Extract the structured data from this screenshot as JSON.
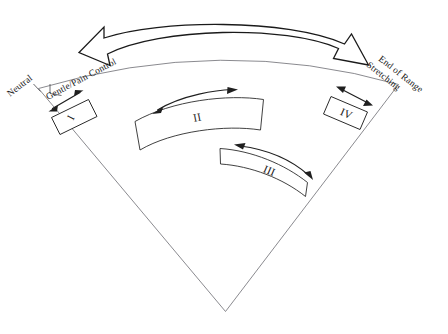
{
  "figure": {
    "kind": "range-of-motion-sector-diagram",
    "canvas": {
      "width": 448,
      "height": 334,
      "background": "#ffffff"
    },
    "colors": {
      "sector_outline": "#7d7d82",
      "band_outline": "#2b2b2b",
      "ribbon_outline": "#1a1a1a",
      "arrow": "#1f1f1f",
      "text": "#1a1a1a"
    }
  },
  "labels": {
    "neutral": "Neutral",
    "gentle_pain_control": "Gentle/Pain Control",
    "stretching": "Stretching",
    "end_of_range": "End of Range"
  },
  "grades": [
    {
      "id": "grade-1",
      "numeral": "I",
      "shape": "small-box",
      "position": "near-neutral"
    },
    {
      "id": "grade-2",
      "numeral": "II",
      "shape": "wide-arc-band",
      "position": "inner-mid"
    },
    {
      "id": "grade-3",
      "numeral": "III",
      "shape": "wide-arc-band",
      "position": "outer-mid"
    },
    {
      "id": "grade-4",
      "numeral": "IV",
      "shape": "small-box",
      "position": "near-end-of-range"
    }
  ],
  "arrows": {
    "overall_range": {
      "style": "hollow-ribbon-double-headed-arc",
      "spans": "Gentle/Pain Control to Stretching"
    },
    "grade_1": {
      "style": "thin-double-headed-straight"
    },
    "grade_2": {
      "style": "thin-double-headed-curved"
    },
    "grade_3": {
      "style": "thin-double-headed-curved"
    },
    "grade_4": {
      "style": "thin-double-headed-straight"
    }
  }
}
